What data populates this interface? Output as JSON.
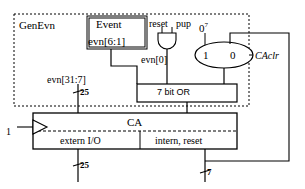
{
  "diagram": {
    "blocks": {
      "genevn_boundary_label": "GenEvn",
      "event_block": {
        "name": "Event",
        "output_bus": "evn[6:1]"
      },
      "or_block": {
        "label": "7 bit OR"
      },
      "ca_block": {
        "label": "CA",
        "left_field": "extern I/O",
        "right_field": "intern, reset"
      },
      "mux": {
        "input_one_label": "1",
        "input_zero_label": "0",
        "constant_input": "0",
        "constant_exponent": "7",
        "select_label": "CAclr"
      },
      "and_gate": {
        "input_a": "reset",
        "input_b": "pup"
      }
    },
    "signals": {
      "evn_low": "evn[0]",
      "evn_high": "evn[31:7]",
      "clock_input": "1",
      "bus_width_top": "25",
      "bus_width_bottom": "25",
      "bus_width_feedback": "7"
    },
    "colors": {
      "line": "#000000",
      "background": "#ffffff",
      "dashed_boundary": "#000000"
    }
  }
}
